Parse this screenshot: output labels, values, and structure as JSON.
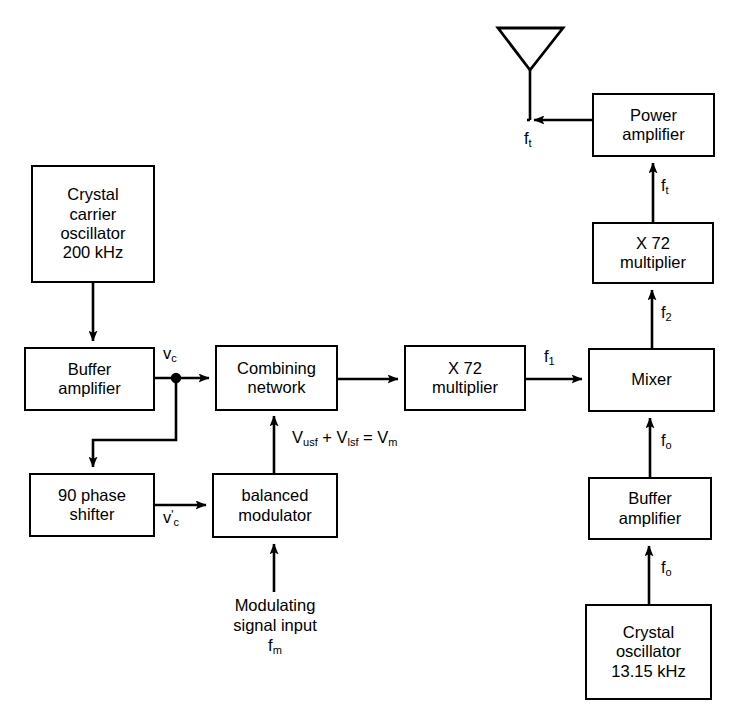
{
  "diagram": {
    "line_color": "#000000",
    "box_fill": "#ffffff",
    "blocks": [
      {
        "id": "crystal_carrier_oscillator",
        "lines": [
          "Crystal",
          "carrier",
          "oscillator",
          "200 kHz"
        ]
      },
      {
        "id": "buffer_amplifier_left",
        "lines": [
          "Buffer",
          "amplifier"
        ]
      },
      {
        "id": "phase_shifter",
        "lines": [
          "90 phase",
          "shifter"
        ]
      },
      {
        "id": "balanced_modulator",
        "lines": [
          "balanced",
          "modulator"
        ]
      },
      {
        "id": "combining_network",
        "lines": [
          "Combining",
          "network"
        ]
      },
      {
        "id": "multiplier_left",
        "lines": [
          "X 72",
          "multiplier"
        ]
      },
      {
        "id": "mixer",
        "lines": [
          "Mixer"
        ]
      },
      {
        "id": "multiplier_right",
        "lines": [
          "X 72",
          "multiplier"
        ]
      },
      {
        "id": "power_amplifier",
        "lines": [
          "Power",
          "amplifier"
        ]
      },
      {
        "id": "buffer_amplifier_right",
        "lines": [
          "Buffer",
          "amplifier"
        ]
      },
      {
        "id": "crystal_oscillator_right",
        "lines": [
          "Crystal",
          "oscillator",
          "13.15 kHz"
        ]
      }
    ],
    "signal_labels": {
      "vc": {
        "base": "v",
        "sub": "c"
      },
      "vc_prime": {
        "base": "v",
        "prime": "'",
        "sub": "c"
      },
      "sideband_sum": {
        "text": "V",
        "sub1": "usf",
        "mid": " + V",
        "sub2": "lsf",
        "tail": " = V",
        "sub3": "m"
      },
      "f1": {
        "base": "f",
        "sub": "1"
      },
      "f2": {
        "base": "f",
        "sub": "2"
      },
      "fo_buffer_in": {
        "base": "f",
        "sub": "o"
      },
      "fo_mixer_in": {
        "base": "f",
        "sub": "o"
      },
      "ft_multiplier_out": {
        "base": "f",
        "sub": "t"
      },
      "ft_antenna": {
        "base": "f",
        "sub": "t"
      },
      "fm": {
        "base": "f",
        "sub": "m"
      }
    },
    "free_text": {
      "modulating_input_line1": "Modulating",
      "modulating_input_line2": "signal input"
    },
    "icons": {
      "antenna": "antenna-icon"
    }
  }
}
